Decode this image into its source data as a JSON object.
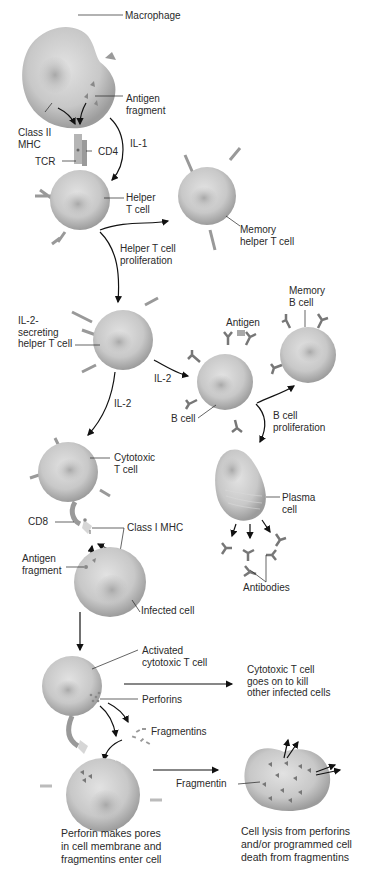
{
  "figure": {
    "colors": {
      "cell_fill": "#c9c9c9",
      "cell_shadow": "#9a9a9a",
      "receptor": "#8c8c8c",
      "arrow": "#111111",
      "text": "#2a2a2a",
      "background": "#ffffff"
    }
  },
  "labels": {
    "macrophage": "Macrophage",
    "antigen_fragment_top": "Antigen\nfragment",
    "class_ii_mhc": "Class II\nMHC",
    "il1": "IL-1",
    "cd4": "CD4",
    "tcr": "TCR",
    "helper_t_cell": "Helper\nT cell",
    "memory_helper_t_cell": "Memory\nhelper T cell",
    "helper_t_proliferation": "Helper T cell\nproliferation",
    "il2_secreting_helper": "IL-2-\nsecreting\nhelper T cell",
    "memory_b_cell": "Memory\nB cell",
    "antigen": "Antigen",
    "il2_right": "IL-2",
    "il2_down": "IL-2",
    "b_cell": "B cell",
    "b_cell_proliferation": "B cell\nproliferation",
    "cytotoxic_t_cell": "Cytotoxic\nT cell",
    "plasma_cell": "Plasma\ncell",
    "cd8": "CD8",
    "class_i_mhc": "Class I MHC",
    "antigen_fragment_mid": "Antigen\nfragment",
    "antibodies": "Antibodies",
    "infected_cell": "Infected cell",
    "activated_cytotoxic": "Activated\ncytotoxic T cell",
    "goes_on": "Cytotoxic T cell\ngoes on to kill\nother infected cells",
    "perforins": "Perforins",
    "fragmentins": "Fragmentins",
    "fragmentin": "Fragmentin"
  },
  "captions": {
    "left": "Perforin makes pores\nin cell membrane and\nfragmentins enter cell",
    "right": "Cell lysis from perforins\nand/or programmed cell\ndeath from fragmentins"
  }
}
